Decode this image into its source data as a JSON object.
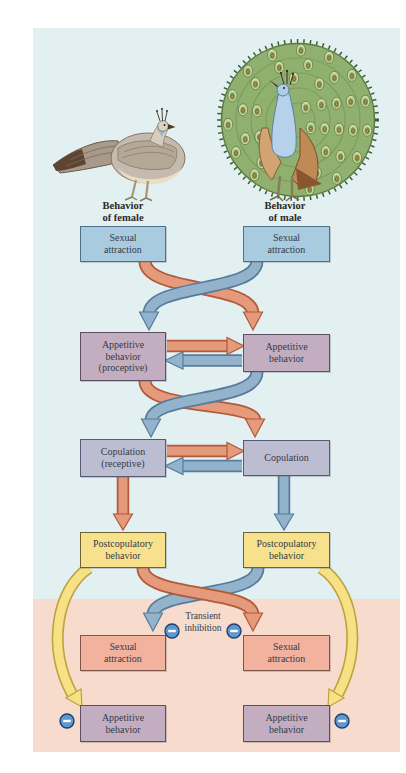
{
  "figure": {
    "female_column_label": "Behavior\nof female",
    "male_column_label": "Behavior\nof male",
    "transient_inhibition_label": "Transient\ninhibition",
    "minus_symbol": "−"
  },
  "boxes": {
    "female": [
      {
        "name": "sexual-attraction",
        "label": "Sexual\nattraction"
      },
      {
        "name": "appetitive-behavior",
        "label": "Appetitive\nbehavior\n(proceptive)"
      },
      {
        "name": "copulation",
        "label": "Copulation\n(receptive)"
      },
      {
        "name": "postcopulatory-behavior",
        "label": "Postcopulatory\nbehavior"
      },
      {
        "name": "sexual-attraction-inhibited",
        "label": "Sexual\nattraction"
      },
      {
        "name": "appetitive-behavior-inhibited",
        "label": "Appetitive\nbehavior"
      }
    ],
    "male": [
      {
        "name": "sexual-attraction",
        "label": "Sexual\nattraction"
      },
      {
        "name": "appetitive-behavior",
        "label": "Appetitive\nbehavior"
      },
      {
        "name": "copulation",
        "label": "Copulation"
      },
      {
        "name": "postcopulatory-behavior",
        "label": "Postcopulatory\nbehavior"
      },
      {
        "name": "sexual-attraction-inhibited",
        "label": "Sexual\nattraction"
      },
      {
        "name": "appetitive-behavior-inhibited",
        "label": "Appetitive\nbehavior"
      }
    ]
  },
  "colors": {
    "background_top": "#e3f0f1",
    "background_bottom": "#f7dccd",
    "box_blue": "#a9cbdf",
    "box_purple": "#c3aec1",
    "box_lavender": "#bdbdd2",
    "box_yellow": "#f8e18c",
    "box_pink": "#f2b29d",
    "arrow_orange": "#e49a7b",
    "arrow_orange_outline": "#b2593a",
    "arrow_blue": "#92b3cb",
    "arrow_blue_outline": "#567b9c",
    "arrow_yellow": "#f6e285",
    "arrow_yellow_outline": "#bfa13e",
    "minus_badge_fill": "#5f97cf",
    "minus_badge_border": "#1f3f73"
  }
}
